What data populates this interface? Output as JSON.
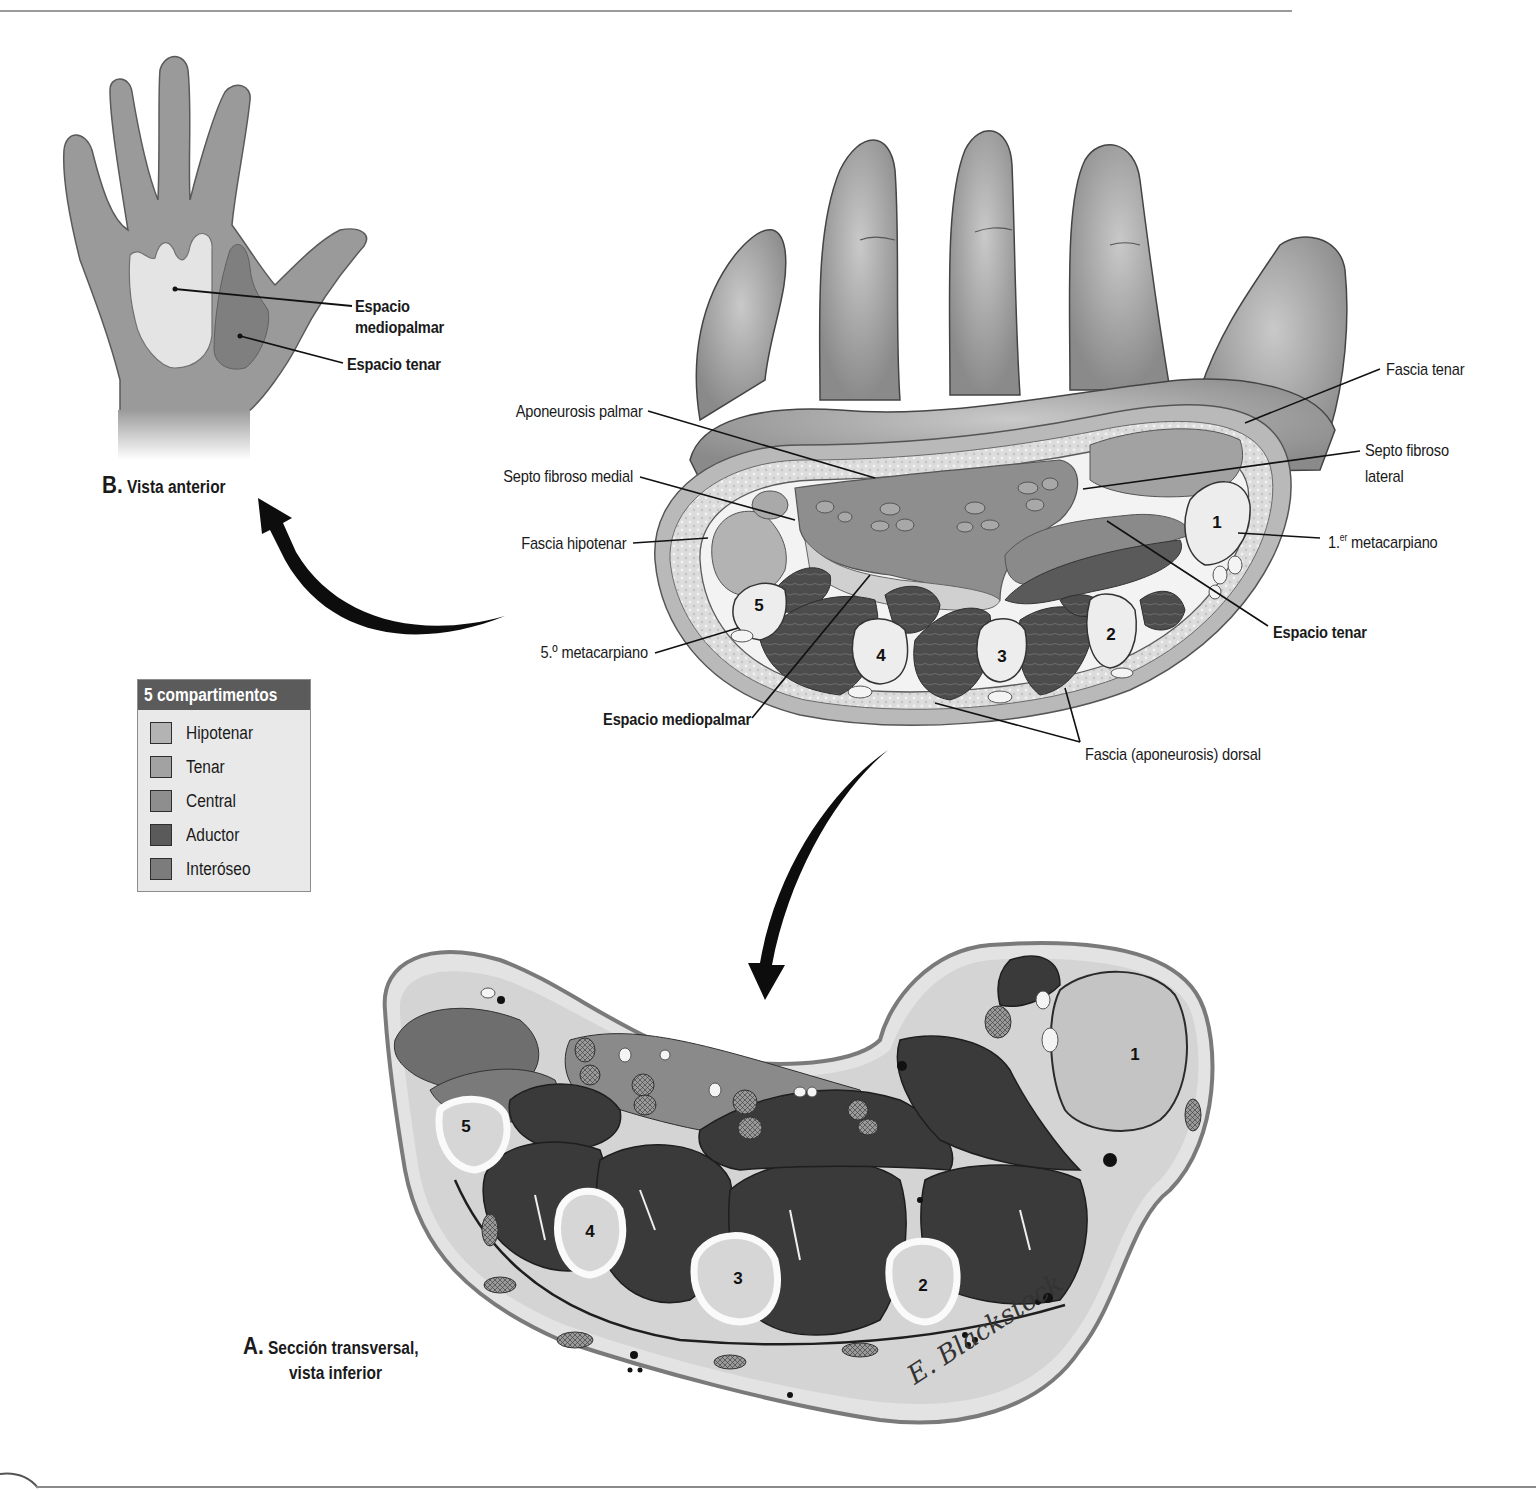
{
  "figure": {
    "panel_b": {
      "caption_letter": "B.",
      "caption_text": "Vista anterior",
      "labels": {
        "espacio_mediopalmar_line1": "Espacio",
        "espacio_mediopalmar_line2": "mediopalmar",
        "espacio_tenar": "Espacio tenar"
      }
    },
    "panel_a": {
      "caption_letter": "A.",
      "caption_line1": "Sección transversal,",
      "caption_line2": "vista inferior",
      "signature": "E. Blackstock"
    },
    "upper_section_labels": {
      "aponeurosis_palmar": "Aponeurosis palmar",
      "septo_fibroso_medial": "Septo fibroso medial",
      "fascia_hipotenar": "Fascia hipotenar",
      "quinto_metacarpiano": "5.º metacarpiano",
      "espacio_mediopalmar": "Espacio mediopalmar",
      "fascia_tenar": "Fascia tenar",
      "septo_fibroso_lateral_line1": "Septo fibroso",
      "septo_fibroso_lateral_line2": "lateral",
      "primer_metacarpiano_num": "1.",
      "primer_metacarpiano_sup": "er",
      "primer_metacarpiano_text": " metacarpiano",
      "espacio_tenar": "Espacio tenar",
      "fascia_dorsal": "Fascia (aponeurosis) dorsal"
    },
    "bone_numbers": {
      "upper": [
        "1",
        "2",
        "3",
        "4",
        "5"
      ],
      "lower": [
        "1",
        "2",
        "3",
        "4",
        "5"
      ]
    },
    "legend": {
      "title": "5 compartimentos",
      "items": [
        {
          "label": "Hipotenar",
          "color": "#b3b3b3"
        },
        {
          "label": "Tenar",
          "color": "#a2a2a2"
        },
        {
          "label": "Central",
          "color": "#8e8e8e"
        },
        {
          "label": "Aductor",
          "color": "#5a5a5a"
        },
        {
          "label": "Interóseo",
          "color": "#7c7c7c"
        }
      ]
    },
    "colors": {
      "hand_fill": "#9a9a9a",
      "mediopalmar_fill": "#e4e4e4",
      "tenar_fill": "#7f7f7f",
      "arrow": "#0d0d0d"
    }
  }
}
